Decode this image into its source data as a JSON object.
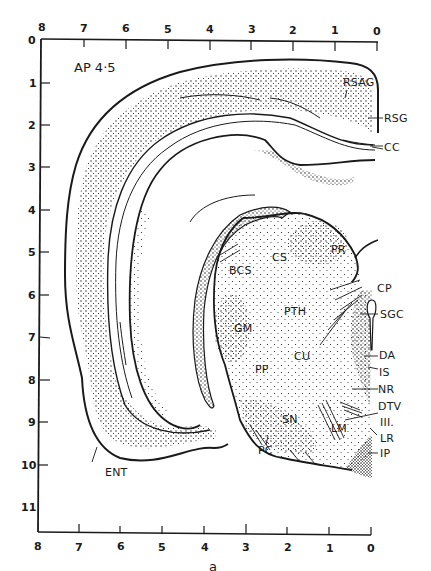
{
  "figure": {
    "section_label": "AP 4·5",
    "caption": "a"
  },
  "axes": {
    "top": {
      "ticks": [
        "8",
        "7",
        "6",
        "5",
        "4",
        "3",
        "2",
        "1",
        "0"
      ]
    },
    "bottom": {
      "ticks": [
        "8",
        "7",
        "6",
        "5",
        "4",
        "3",
        "2",
        "1",
        "0"
      ]
    },
    "left": {
      "ticks": [
        "0",
        "1",
        "2",
        "3",
        "4",
        "5",
        "6",
        "7",
        "8",
        "9",
        "10",
        "11"
      ]
    }
  },
  "structures": [
    {
      "abbr": "RSAG"
    },
    {
      "abbr": "RSG"
    },
    {
      "abbr": "CC"
    },
    {
      "abbr": "PR"
    },
    {
      "abbr": "CS"
    },
    {
      "abbr": "BCS"
    },
    {
      "abbr": "CP"
    },
    {
      "abbr": "PTH"
    },
    {
      "abbr": "SGC"
    },
    {
      "abbr": "GM"
    },
    {
      "abbr": "CU"
    },
    {
      "abbr": "DA"
    },
    {
      "abbr": "IS"
    },
    {
      "abbr": "PP"
    },
    {
      "abbr": "NR"
    },
    {
      "abbr": "DTV"
    },
    {
      "abbr": "III."
    },
    {
      "abbr": "SN"
    },
    {
      "abbr": "LM"
    },
    {
      "abbr": "LR"
    },
    {
      "abbr": "PC"
    },
    {
      "abbr": "IP"
    },
    {
      "abbr": "ENT"
    }
  ],
  "colors": {
    "ink": "#1a1a1a",
    "paper": "#ffffff"
  }
}
